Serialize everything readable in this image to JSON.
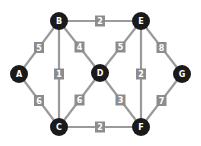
{
  "graph": {
    "nodes": [
      {
        "id": "A",
        "label": "A",
        "x": 19,
        "y": 74
      },
      {
        "id": "B",
        "label": "B",
        "x": 59,
        "y": 21
      },
      {
        "id": "E",
        "label": "E",
        "x": 141,
        "y": 21
      },
      {
        "id": "D",
        "label": "D",
        "x": 100,
        "y": 73
      },
      {
        "id": "G",
        "label": "G",
        "x": 182,
        "y": 74
      },
      {
        "id": "C",
        "label": "C",
        "x": 59,
        "y": 127
      },
      {
        "id": "F",
        "label": "F",
        "x": 141,
        "y": 127
      }
    ],
    "edges": [
      {
        "from": "A",
        "to": "B",
        "weight": "5"
      },
      {
        "from": "A",
        "to": "C",
        "weight": "6"
      },
      {
        "from": "B",
        "to": "E",
        "weight": "2"
      },
      {
        "from": "B",
        "to": "C",
        "weight": "1"
      },
      {
        "from": "B",
        "to": "D",
        "weight": "4"
      },
      {
        "from": "E",
        "to": "D",
        "weight": "5"
      },
      {
        "from": "E",
        "to": "F",
        "weight": "2"
      },
      {
        "from": "E",
        "to": "G",
        "weight": "8"
      },
      {
        "from": "D",
        "to": "C",
        "weight": "6"
      },
      {
        "from": "D",
        "to": "F",
        "weight": "3"
      },
      {
        "from": "C",
        "to": "F",
        "weight": "2"
      },
      {
        "from": "G",
        "to": "F",
        "weight": "7"
      }
    ]
  },
  "colors": {
    "node_fill": "#1a1a1a",
    "edge": "#9a9a9a",
    "label_box": "#8c8c8c",
    "text": "#ffffff"
  }
}
